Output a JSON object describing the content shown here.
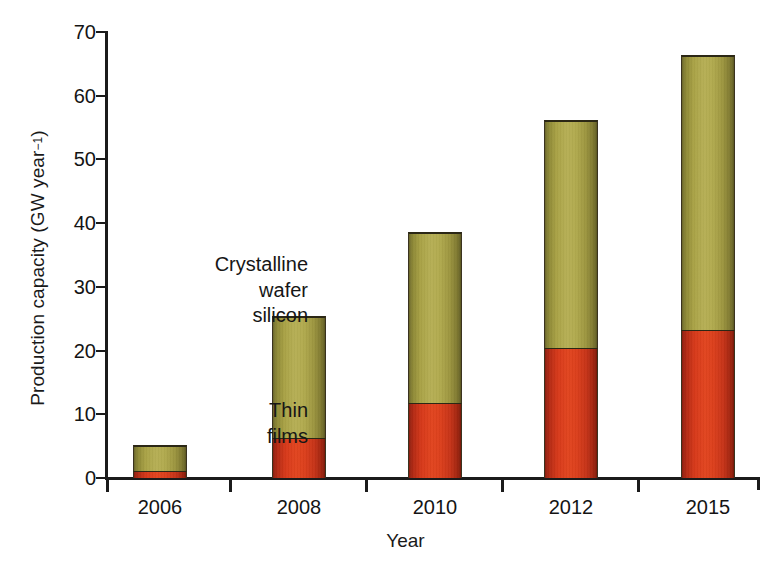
{
  "chart_data": {
    "type": "bar",
    "subtype": "stacked-vertical",
    "title": "",
    "xlabel": "Year",
    "ylabel": "Production capacity (GW year⁻¹)",
    "ylabel_text": "Production capacity (GW year",
    "ylabel_sup": "−1",
    "ylabel_close": ")",
    "categories": [
      "2006",
      "2008",
      "2010",
      "2012",
      "2015"
    ],
    "ylim": [
      0,
      70
    ],
    "yticks": [
      0,
      10,
      20,
      30,
      40,
      50,
      60,
      70
    ],
    "ytick_labels": [
      "0",
      "10",
      "20",
      "30",
      "40",
      "50",
      "60",
      "70"
    ],
    "grid": false,
    "legend": "annotations",
    "series": [
      {
        "name": "Thin films",
        "color": "#d6391a",
        "values": [
          1.0,
          6.1,
          11.6,
          20.2,
          23.1
        ]
      },
      {
        "name": "Crystalline wafer silicon",
        "color": "#b2ab4f",
        "values": [
          4.2,
          19.3,
          27.0,
          36.0,
          43.3
        ]
      }
    ],
    "totals": [
      5.2,
      25.4,
      38.6,
      56.2,
      66.4
    ],
    "annotations": [
      {
        "id": "crystalline",
        "lines": [
          "Crystalline",
          "wafer",
          "silicon"
        ],
        "target_series": "Crystalline wafer silicon",
        "target_category": "2008"
      },
      {
        "id": "thin-films",
        "lines": [
          "Thin",
          "films"
        ],
        "target_series": "Thin films",
        "target_category": "2008"
      }
    ]
  },
  "colors": {
    "crystalline": "#b2ab4f",
    "thin_films": "#d6391a",
    "axis": "#1b1b1b",
    "text": "#141414",
    "background": "#ffffff"
  }
}
